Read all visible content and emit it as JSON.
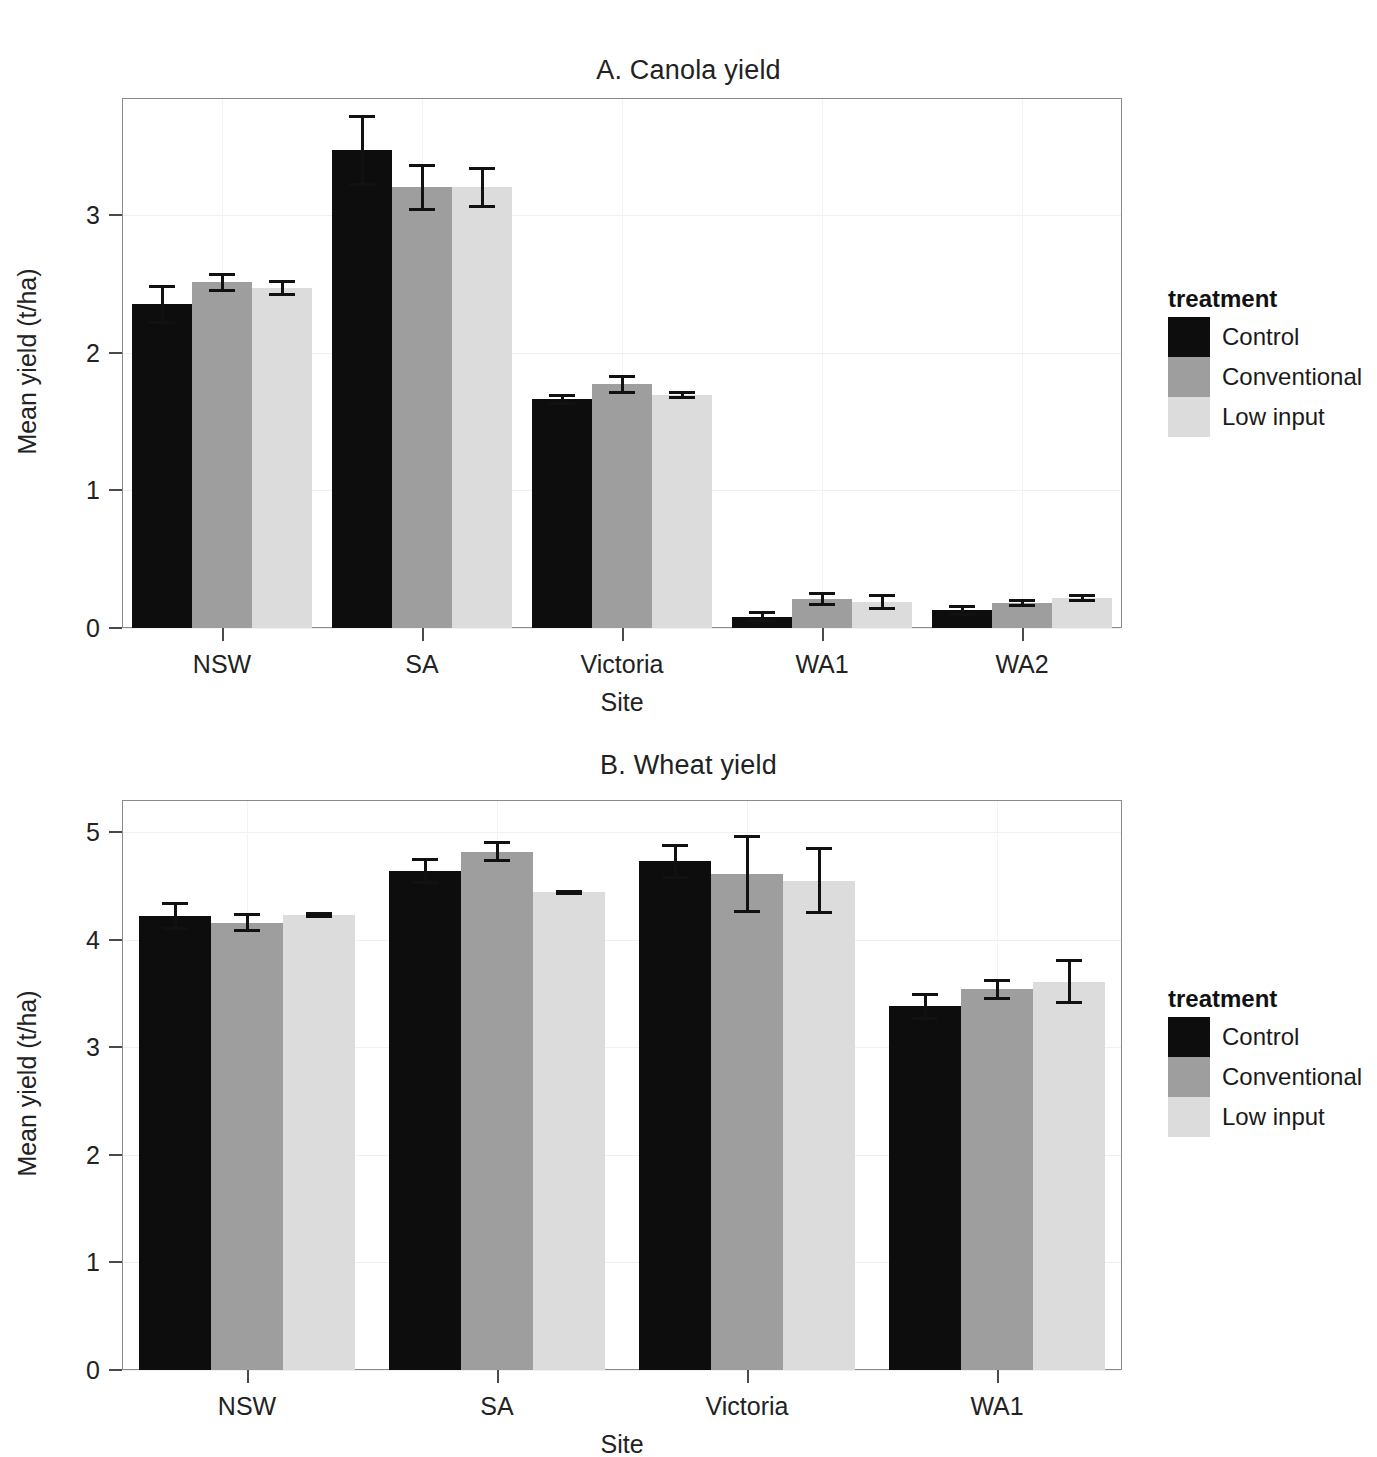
{
  "figure": {
    "background": "#ffffff",
    "series_colors": [
      "#0d0d0d",
      "#9e9e9e",
      "#dcdcdc"
    ]
  },
  "legend": {
    "title": "treatment",
    "entries": [
      "Control",
      "Conventional",
      "Low input"
    ]
  },
  "chart_data": [
    {
      "type": "bar",
      "title": "A. Canola yield",
      "xlabel": "Site",
      "ylabel": "Mean yield (t/ha)",
      "categories": [
        "NSW",
        "SA",
        "Victoria",
        "WA1",
        "WA2"
      ],
      "yticks": [
        "0",
        "1",
        "2",
        "3"
      ],
      "ylim": [
        0,
        3.85
      ],
      "grid": true,
      "legend_position": "right",
      "series": [
        {
          "name": "Control",
          "color": "#0d0d0d",
          "values": [
            2.35,
            3.47,
            1.66,
            0.08,
            0.13
          ],
          "errors": [
            0.14,
            0.26,
            0.04,
            0.04,
            0.04
          ]
        },
        {
          "name": "Conventional",
          "color": "#9e9e9e",
          "values": [
            2.51,
            3.2,
            1.77,
            0.21,
            0.18
          ],
          "errors": [
            0.07,
            0.17,
            0.07,
            0.05,
            0.03
          ]
        },
        {
          "name": "Low input",
          "color": "#dcdcdc",
          "values": [
            2.47,
            3.2,
            1.69,
            0.19,
            0.22
          ],
          "errors": [
            0.06,
            0.15,
            0.03,
            0.06,
            0.03
          ]
        }
      ]
    },
    {
      "type": "bar",
      "title": "B. Wheat yield",
      "xlabel": "Site",
      "ylabel": "Mean yield (t/ha)",
      "categories": [
        "NSW",
        "SA",
        "Victoria",
        "WA1"
      ],
      "yticks": [
        "0",
        "1",
        "2",
        "3",
        "4",
        "5"
      ],
      "ylim": [
        0,
        5.3
      ],
      "grid": true,
      "legend_position": "right",
      "series": [
        {
          "name": "Control",
          "color": "#0d0d0d",
          "values": [
            4.22,
            4.64,
            4.73,
            3.38
          ],
          "errors": [
            0.13,
            0.12,
            0.16,
            0.13
          ]
        },
        {
          "name": "Conventional",
          "color": "#9e9e9e",
          "values": [
            4.16,
            4.82,
            4.61,
            3.54
          ],
          "errors": [
            0.09,
            0.1,
            0.36,
            0.1
          ]
        },
        {
          "name": "Low input",
          "color": "#dcdcdc",
          "values": [
            4.23,
            4.44,
            4.55,
            3.61
          ],
          "errors": [
            0.03,
            0.02,
            0.31,
            0.21
          ]
        }
      ]
    }
  ]
}
